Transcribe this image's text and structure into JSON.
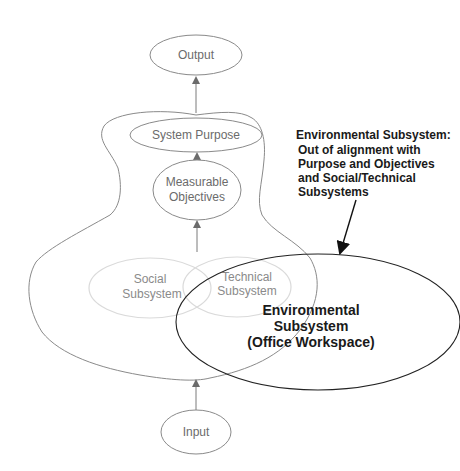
{
  "diagram": {
    "nodes": {
      "output": {
        "label": "Output"
      },
      "system_purpose": {
        "label": "System Purpose"
      },
      "measurable_objectives": {
        "lines": [
          "Measurable",
          "Objectives"
        ]
      },
      "social_subsystem": {
        "lines": [
          "Social",
          "Subsystem"
        ]
      },
      "technical_subsystem": {
        "lines": [
          "Technical",
          "Subsystem"
        ]
      },
      "environmental_subsystem": {
        "lines": [
          "Environmental",
          "Subsystem",
          "(Office Workspace)"
        ]
      },
      "input": {
        "label": "Input"
      }
    },
    "annotation": {
      "title": "Environmental Subsystem:",
      "lines": [
        "Out of alignment with",
        "Purpose and Objectives",
        "and Social/Technical",
        "Subsystems"
      ]
    },
    "edges": [
      {
        "from": "input",
        "to": "system_boundary"
      },
      {
        "from": "social_technical",
        "to": "measurable_objectives"
      },
      {
        "from": "measurable_objectives",
        "to": "system_purpose"
      },
      {
        "from": "system_boundary",
        "to": "output"
      },
      {
        "from": "annotation",
        "to": "environmental_subsystem"
      }
    ],
    "colors": {
      "outline": "#8a8a8a",
      "faint_outline": "#d8d8d8",
      "strong_outline": "#222222",
      "text_gray": "#6b6b6b",
      "text_dark": "#1a1a1a"
    }
  }
}
